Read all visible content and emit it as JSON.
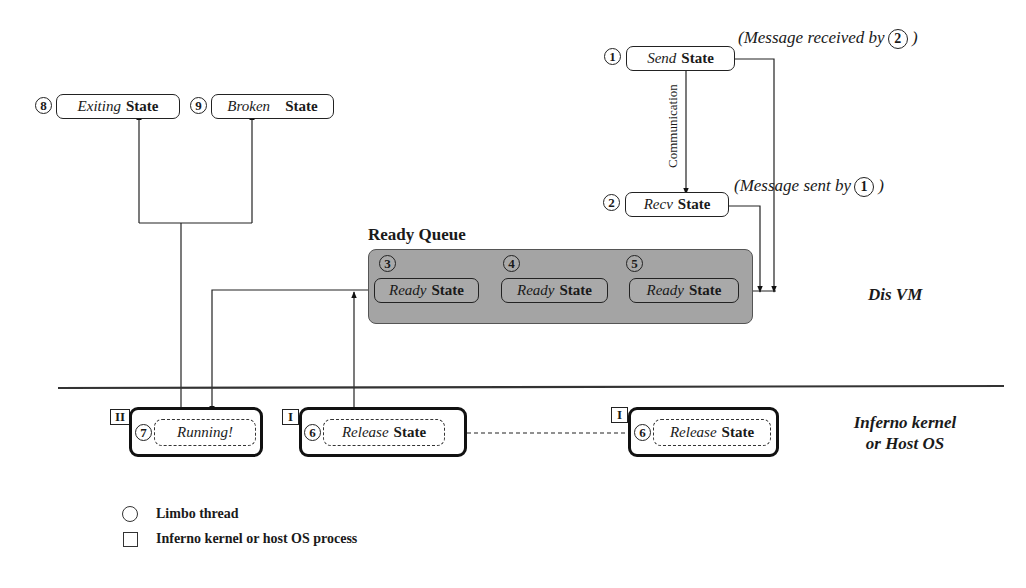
{
  "states": {
    "s1": {
      "num": "1",
      "italic": "Send",
      "bold": "State"
    },
    "s2": {
      "num": "2",
      "italic": "Recv",
      "bold": "State"
    },
    "s3": {
      "num": "3",
      "italic": "Ready",
      "bold": "State"
    },
    "s4": {
      "num": "4",
      "italic": "Ready",
      "bold": "State"
    },
    "s5": {
      "num": "5",
      "italic": "Ready",
      "bold": "State"
    },
    "s6a": {
      "num": "6",
      "italic": "Release",
      "bold": "State",
      "process": "I"
    },
    "s6b": {
      "num": "6",
      "italic": "Release",
      "bold": "State",
      "process": "I"
    },
    "s7": {
      "num": "7",
      "italic": "Running!",
      "bold": "",
      "process": "II"
    },
    "s8": {
      "num": "8",
      "italic": "Exiting",
      "bold": "State"
    },
    "s9": {
      "num": "9",
      "italic": "Broken",
      "bold": "State"
    }
  },
  "notes": {
    "received": {
      "text": "(Message received by",
      "ref": "2",
      "close": ")"
    },
    "sent": {
      "text": "(Message sent by",
      "ref": "1",
      "close": ")"
    }
  },
  "communication_label": "Communication",
  "ready_queue_title": "Ready Queue",
  "regions": {
    "vm": "Dis VM",
    "kernel_line1": "Inferno kernel",
    "kernel_line2": "or Host OS"
  },
  "legend": {
    "circle": "Limbo thread",
    "square": "Inferno kernel or host OS process"
  }
}
